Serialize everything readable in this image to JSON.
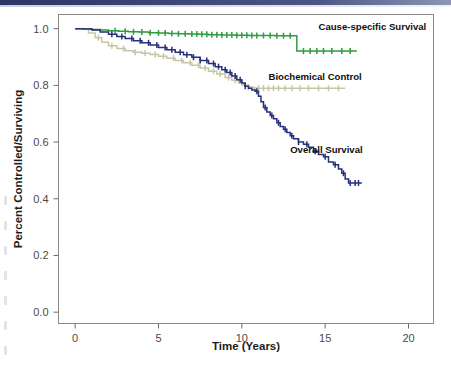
{
  "figure": {
    "background_color": "#ffffff",
    "header_rule_color": "#2b3566",
    "plot_border_color": "#8a8a8a"
  },
  "chart_data": {
    "type": "line",
    "subtype": "kaplan-meier-step",
    "title": "",
    "xlabel": "Time (Years)",
    "ylabel": "Percent Controlled/Surviving",
    "xlim": [
      -1.0,
      21.5
    ],
    "ylim": [
      -0.04,
      1.05
    ],
    "xticks": [
      0,
      5,
      10,
      15,
      20
    ],
    "xtick_labels": [
      "0",
      "5",
      "10",
      "15",
      "20"
    ],
    "yticks": [
      0.0,
      0.2,
      0.4,
      0.6,
      0.8,
      1.0
    ],
    "ytick_labels": [
      "0.0",
      "0.2",
      "0.4",
      "0.6",
      "0.8",
      "1.0"
    ],
    "grid": false,
    "legend": "inline-annotations",
    "series": [
      {
        "name": "Cause-specific Survival",
        "color": "#2e9b3e",
        "label_position": {
          "x": 14.6,
          "y": 1.005
        },
        "label_anchor": "start",
        "points": [
          [
            0.0,
            1.0
          ],
          [
            0.6,
            1.0
          ],
          [
            1.0,
            0.997
          ],
          [
            1.5,
            0.995
          ],
          [
            2.0,
            0.993
          ],
          [
            2.6,
            0.991
          ],
          [
            3.2,
            0.989
          ],
          [
            3.8,
            0.988
          ],
          [
            4.4,
            0.986
          ],
          [
            5.0,
            0.985
          ],
          [
            5.6,
            0.983
          ],
          [
            6.2,
            0.982
          ],
          [
            6.8,
            0.981
          ],
          [
            7.4,
            0.98
          ],
          [
            8.0,
            0.979
          ],
          [
            8.8,
            0.978
          ],
          [
            9.6,
            0.977
          ],
          [
            10.4,
            0.976
          ],
          [
            11.2,
            0.976
          ],
          [
            12.0,
            0.975
          ],
          [
            12.8,
            0.975
          ],
          [
            13.3,
            0.975
          ],
          [
            13.3,
            0.921
          ],
          [
            14.2,
            0.921
          ],
          [
            15.0,
            0.921
          ],
          [
            16.0,
            0.921
          ],
          [
            16.9,
            0.921
          ]
        ],
        "censor_marks": [
          2.4,
          3.0,
          3.5,
          4.0,
          4.5,
          5.0,
          5.4,
          5.8,
          6.2,
          6.6,
          7.0,
          7.3,
          7.6,
          7.9,
          8.2,
          8.5,
          8.8,
          9.1,
          9.4,
          9.7,
          10.0,
          10.3,
          10.6,
          10.9,
          11.3,
          11.7,
          12.1,
          12.5,
          12.9,
          13.7,
          14.1,
          14.5,
          14.9,
          15.4,
          16.0,
          16.5
        ],
        "plateau_value": 0.921,
        "end_time": 16.9
      },
      {
        "name": "Biochemical Control",
        "color": "#c6c7a4",
        "label_position": {
          "x": 11.6,
          "y": 0.828
        },
        "label_anchor": "start",
        "points": [
          [
            0.0,
            1.0
          ],
          [
            0.4,
            0.998
          ],
          [
            0.8,
            0.985
          ],
          [
            1.2,
            0.968
          ],
          [
            1.6,
            0.952
          ],
          [
            2.0,
            0.94
          ],
          [
            2.5,
            0.93
          ],
          [
            3.0,
            0.922
          ],
          [
            3.5,
            0.917
          ],
          [
            4.0,
            0.913
          ],
          [
            4.5,
            0.909
          ],
          [
            5.0,
            0.903
          ],
          [
            5.5,
            0.896
          ],
          [
            6.0,
            0.888
          ],
          [
            6.5,
            0.88
          ],
          [
            7.0,
            0.871
          ],
          [
            7.5,
            0.861
          ],
          [
            8.0,
            0.85
          ],
          [
            8.5,
            0.84
          ],
          [
            9.0,
            0.828
          ],
          [
            9.4,
            0.818
          ],
          [
            9.8,
            0.808
          ],
          [
            10.1,
            0.8
          ],
          [
            10.4,
            0.794
          ],
          [
            10.7,
            0.791
          ],
          [
            11.0,
            0.79
          ],
          [
            12.0,
            0.79
          ],
          [
            13.0,
            0.79
          ],
          [
            14.0,
            0.79
          ],
          [
            15.0,
            0.79
          ],
          [
            16.2,
            0.79
          ]
        ],
        "censor_marks": [
          1.4,
          2.2,
          2.9,
          3.6,
          4.2,
          4.8,
          5.3,
          5.9,
          6.4,
          6.9,
          7.4,
          7.8,
          8.3,
          8.7,
          9.2,
          9.6,
          10.0,
          10.4,
          11.0,
          11.3,
          11.6,
          11.9,
          12.2,
          12.6,
          13.0,
          13.5,
          14.0,
          14.6,
          15.2,
          15.8
        ],
        "plateau_value": 0.79,
        "end_time": 16.2
      },
      {
        "name": "Overall Survival",
        "color": "#26307a",
        "label_position": {
          "x": 12.9,
          "y": 0.573
        },
        "label_anchor": "start",
        "points": [
          [
            0.0,
            1.0
          ],
          [
            0.5,
            0.999
          ],
          [
            1.0,
            0.995
          ],
          [
            1.5,
            0.988
          ],
          [
            2.0,
            0.98
          ],
          [
            2.5,
            0.972
          ],
          [
            3.0,
            0.965
          ],
          [
            3.5,
            0.957
          ],
          [
            4.0,
            0.95
          ],
          [
            4.5,
            0.942
          ],
          [
            5.0,
            0.934
          ],
          [
            5.5,
            0.926
          ],
          [
            6.0,
            0.917
          ],
          [
            6.5,
            0.908
          ],
          [
            7.0,
            0.899
          ],
          [
            7.5,
            0.888
          ],
          [
            8.0,
            0.877
          ],
          [
            8.4,
            0.866
          ],
          [
            8.8,
            0.855
          ],
          [
            9.1,
            0.845
          ],
          [
            9.4,
            0.833
          ],
          [
            9.7,
            0.82
          ],
          [
            10.0,
            0.808
          ],
          [
            10.2,
            0.797
          ],
          [
            10.4,
            0.79
          ],
          [
            10.6,
            0.784
          ],
          [
            10.8,
            0.779
          ],
          [
            11.0,
            0.762
          ],
          [
            11.15,
            0.742
          ],
          [
            11.3,
            0.722
          ],
          [
            11.5,
            0.706
          ],
          [
            11.7,
            0.694
          ],
          [
            11.9,
            0.682
          ],
          [
            12.1,
            0.668
          ],
          [
            12.3,
            0.655
          ],
          [
            12.5,
            0.645
          ],
          [
            12.7,
            0.634
          ],
          [
            12.9,
            0.622
          ],
          [
            13.1,
            0.612
          ],
          [
            13.4,
            0.6
          ],
          [
            13.7,
            0.592
          ],
          [
            14.0,
            0.582
          ],
          [
            14.3,
            0.568
          ],
          [
            14.6,
            0.556
          ],
          [
            14.9,
            0.548
          ],
          [
            15.2,
            0.53
          ],
          [
            15.5,
            0.52
          ],
          [
            15.8,
            0.505
          ],
          [
            16.0,
            0.49
          ],
          [
            16.2,
            0.47
          ],
          [
            16.4,
            0.456
          ],
          [
            16.8,
            0.456
          ],
          [
            17.2,
            0.456
          ]
        ],
        "censor_marks": [
          2.2,
          2.8,
          3.4,
          3.9,
          4.4,
          4.9,
          5.4,
          5.8,
          6.3,
          6.7,
          7.1,
          7.5,
          7.9,
          8.3,
          8.6,
          9.0,
          9.3,
          9.6,
          9.9,
          10.2,
          10.9,
          11.4,
          11.8,
          12.2,
          12.6,
          13.0,
          13.4,
          13.9,
          14.4,
          15.0,
          15.6,
          16.1,
          16.5,
          16.8,
          17.0
        ],
        "plateau_value": 0.456,
        "end_time": 17.2
      }
    ]
  }
}
